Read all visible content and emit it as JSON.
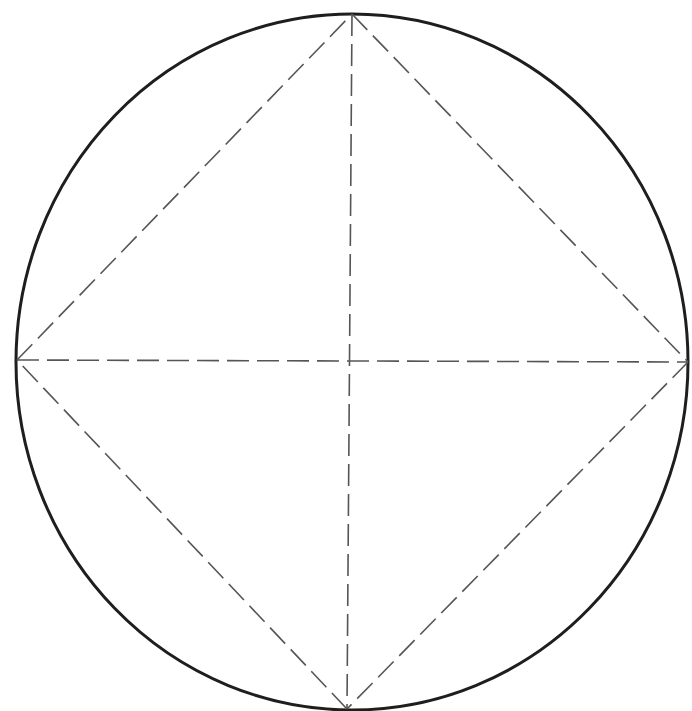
{
  "diagram": {
    "colors": {
      "background": "#ffffff",
      "circle_stroke": "#1e1e1e",
      "dash_stroke": "#555555"
    },
    "circle": {
      "cx": 352,
      "cy": 362,
      "rx": 336,
      "ry": 348,
      "stroke_width": 3
    },
    "vertices": {
      "top": [
        352,
        14
      ],
      "right": [
        688,
        362
      ],
      "bottom": [
        347,
        709
      ],
      "left": [
        17,
        360
      ]
    },
    "center": [
      350,
      362
    ],
    "dash_pattern": "22 8",
    "dash_width": 1.6,
    "shapes": [
      {
        "id": "square-edge-top-right",
        "from": "top",
        "to": "right"
      },
      {
        "id": "square-edge-right-bottom",
        "from": "right",
        "to": "bottom"
      },
      {
        "id": "square-edge-bottom-left",
        "from": "bottom",
        "to": "left"
      },
      {
        "id": "square-edge-left-top",
        "from": "left",
        "to": "top"
      },
      {
        "id": "diagonal-vertical",
        "from": "top",
        "to": "bottom"
      },
      {
        "id": "diagonal-horizontal",
        "from": "left",
        "to": "right"
      }
    ]
  }
}
